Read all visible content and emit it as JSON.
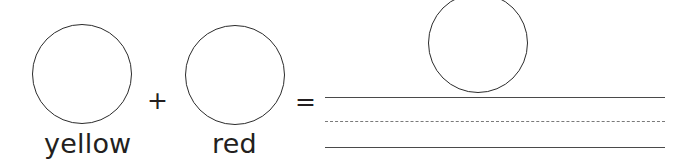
{
  "figure": {
    "type": "color-mixing-diagram",
    "background_color": "#ffffff",
    "stroke_color": "#2b2b2b",
    "rule_color": "#4a4a4a",
    "dashed_rule_color": "#7a7a7a",
    "text_color": "#231f20",
    "operands": [
      {
        "shape": "circle",
        "label": "yellow",
        "fill": "none",
        "outline": "#2b2b2b"
      },
      {
        "shape": "circle",
        "label": "red",
        "fill": "none",
        "outline": "#2b2b2b"
      }
    ],
    "operators": {
      "plus": "+",
      "equals": "="
    },
    "result": {
      "shape": "circle",
      "label": "",
      "fill": "none",
      "outline": "#2b2b2b",
      "rules": [
        {
          "style": "solid",
          "name": "top-rule"
        },
        {
          "style": "dashed",
          "name": "middle-rule"
        },
        {
          "style": "solid",
          "name": "bottom-rule"
        }
      ]
    }
  }
}
